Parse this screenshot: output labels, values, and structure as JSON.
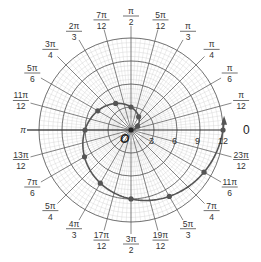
{
  "chart_data": {
    "type": "line",
    "subtype": "polar",
    "title": "",
    "equation": "r = 2θ",
    "center_label": "O",
    "polar_axis_label": "0",
    "radial_ticks": [
      3,
      6,
      9,
      12
    ],
    "radial_range": [
      0,
      12
    ],
    "angle_labels": [
      {
        "num": "π",
        "den": "12",
        "coef": "",
        "angle_deg": 15
      },
      {
        "num": "π",
        "den": "6",
        "coef": "",
        "angle_deg": 30
      },
      {
        "num": "π",
        "den": "4",
        "coef": "",
        "angle_deg": 45
      },
      {
        "num": "π",
        "den": "3",
        "coef": "",
        "angle_deg": 60
      },
      {
        "num": "5π",
        "den": "12",
        "coef": "",
        "angle_deg": 75
      },
      {
        "num": "π",
        "den": "2",
        "coef": "",
        "angle_deg": 90
      },
      {
        "num": "7π",
        "den": "12",
        "coef": "",
        "angle_deg": 105
      },
      {
        "num": "2π",
        "den": "3",
        "coef": "",
        "angle_deg": 120
      },
      {
        "num": "3π",
        "den": "4",
        "coef": "",
        "angle_deg": 135
      },
      {
        "num": "5π",
        "den": "6",
        "coef": "",
        "angle_deg": 150
      },
      {
        "num": "11π",
        "den": "12",
        "coef": "",
        "angle_deg": 165
      },
      {
        "num": "π",
        "den": "",
        "coef": "",
        "angle_deg": 180
      },
      {
        "num": "13π",
        "den": "12",
        "coef": "",
        "angle_deg": 195
      },
      {
        "num": "7π",
        "den": "6",
        "coef": "",
        "angle_deg": 210
      },
      {
        "num": "5π",
        "den": "4",
        "coef": "",
        "angle_deg": 225
      },
      {
        "num": "4π",
        "den": "3",
        "coef": "",
        "angle_deg": 240
      },
      {
        "num": "17π",
        "den": "12",
        "coef": "",
        "angle_deg": 255
      },
      {
        "num": "3π",
        "den": "2",
        "coef": "",
        "angle_deg": 270
      },
      {
        "num": "19π",
        "den": "12",
        "coef": "",
        "angle_deg": 285
      },
      {
        "num": "5π",
        "den": "3",
        "coef": "",
        "angle_deg": 300
      },
      {
        "num": "7π",
        "den": "4",
        "coef": "",
        "angle_deg": 315
      },
      {
        "num": "11π",
        "den": "6",
        "coef": "",
        "angle_deg": 330
      },
      {
        "num": "23π",
        "den": "12",
        "coef": "",
        "angle_deg": 345
      }
    ],
    "series": [
      {
        "name": "r = 2θ",
        "theta": [
          "0",
          "π/6",
          "π/3",
          "π/2",
          "2π/3",
          "5π/6",
          "π",
          "7π/6",
          "4π/3",
          "3π/2",
          "5π/3",
          "11π/6",
          "2π"
        ],
        "theta_rad": [
          0,
          0.5236,
          1.0472,
          1.5708,
          2.0944,
          2.618,
          3.1416,
          3.6652,
          4.1888,
          4.7124,
          5.236,
          5.7596,
          6.2832
        ],
        "r": [
          0,
          1.05,
          2.09,
          3.14,
          4.19,
          5.24,
          6.28,
          7.33,
          8.38,
          9.42,
          10.47,
          11.52,
          12.57
        ]
      }
    ],
    "grid": true,
    "colors": {
      "curve": "#555555",
      "grid_major": "#555555",
      "grid_minor": "#cccccc",
      "text": "#333333"
    }
  }
}
